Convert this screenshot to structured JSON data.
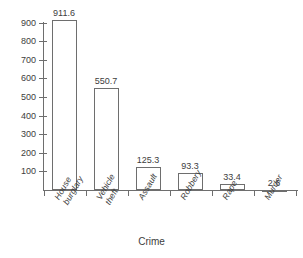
{
  "chart_data": {
    "type": "bar",
    "title": "",
    "xlabel": "Crime",
    "ylabel": "",
    "categories": [
      "House burglary",
      "Vehicle theft",
      "Assault",
      "Robbery",
      "Rape",
      "Murder"
    ],
    "values": [
      911.6,
      550.7,
      125.3,
      93.3,
      33.4,
      2.6
    ],
    "value_labels": [
      "911.6",
      "550.7",
      "125.3",
      "93.3",
      "33.4",
      "2.6"
    ],
    "ylim": [
      0,
      950
    ],
    "ytick_values": [
      100,
      200,
      300,
      400,
      500,
      600,
      700,
      800,
      900
    ],
    "ytick_labels": [
      "100",
      "200",
      "300",
      "400",
      "500",
      "600",
      "700",
      "800",
      "900"
    ],
    "grid": false,
    "legend": false,
    "bar_fill": "#ffffff",
    "bar_edge": "#6e6e6e",
    "axis_color": "#6e6e6e",
    "text_color": "#3d3d3d"
  },
  "axes": {
    "x_title": "Crime"
  },
  "categories": [
    {
      "line1": "House",
      "line2": "burglary",
      "full": "House burglary"
    },
    {
      "line1": "Vehicle",
      "line2": "theft",
      "full": "Vehicle theft"
    },
    {
      "line1": "Assault",
      "line2": "",
      "full": "Assault"
    },
    {
      "line1": "Robbery",
      "line2": "",
      "full": "Robbery"
    },
    {
      "line1": "Rape",
      "line2": "",
      "full": "Rape"
    },
    {
      "line1": "Murder",
      "line2": "",
      "full": "Murder"
    }
  ],
  "ghost": {
    "top_strip": ""
  }
}
